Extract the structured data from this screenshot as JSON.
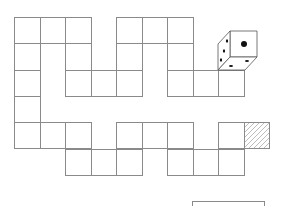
{
  "diagram": {
    "type": "board-game-path",
    "grid": {
      "origin_x": 14,
      "origin_y": 17,
      "cell_w": 25.5,
      "cell_h": 26.3,
      "line_color": "#8a8a8a"
    },
    "cells": [
      {
        "row": 0,
        "col": 0
      },
      {
        "row": 0,
        "col": 1
      },
      {
        "row": 0,
        "col": 2
      },
      {
        "row": 0,
        "col": 4
      },
      {
        "row": 0,
        "col": 5
      },
      {
        "row": 0,
        "col": 6
      },
      {
        "row": 1,
        "col": 0
      },
      {
        "row": 1,
        "col": 2
      },
      {
        "row": 1,
        "col": 4
      },
      {
        "row": 1,
        "col": 6
      },
      {
        "row": 2,
        "col": 0
      },
      {
        "row": 2,
        "col": 2
      },
      {
        "row": 2,
        "col": 3
      },
      {
        "row": 2,
        "col": 4
      },
      {
        "row": 2,
        "col": 6
      },
      {
        "row": 2,
        "col": 7
      },
      {
        "row": 2,
        "col": 8
      },
      {
        "row": 3,
        "col": 0
      },
      {
        "row": 4,
        "col": 0
      },
      {
        "row": 4,
        "col": 1
      },
      {
        "row": 4,
        "col": 2
      },
      {
        "row": 4,
        "col": 4
      },
      {
        "row": 4,
        "col": 5
      },
      {
        "row": 4,
        "col": 6
      },
      {
        "row": 4,
        "col": 8
      },
      {
        "row": 4,
        "col": 9,
        "hatched": true
      },
      {
        "row": 5,
        "col": 2
      },
      {
        "row": 5,
        "col": 3
      },
      {
        "row": 5,
        "col": 4
      },
      {
        "row": 5,
        "col": 6
      },
      {
        "row": 5,
        "col": 7
      },
      {
        "row": 5,
        "col": 8
      }
    ],
    "die": {
      "position": "on cell row 2 col 8",
      "top_face": 1,
      "left_face": 3,
      "bottom_face": 2
    },
    "answer_box": true
  }
}
